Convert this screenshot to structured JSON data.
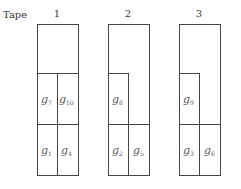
{
  "header": {
    "label": "Tape"
  },
  "tapes": [
    {
      "number": "1",
      "cells": [
        {
          "id": "g7",
          "base": "g",
          "sub": "7"
        },
        {
          "id": "g10",
          "base": "g",
          "sub": "10"
        },
        {
          "id": "g1",
          "base": "g",
          "sub": "1"
        },
        {
          "id": "g4",
          "base": "g",
          "sub": "4"
        }
      ]
    },
    {
      "number": "2",
      "cells": [
        {
          "id": "g8",
          "base": "g",
          "sub": "8"
        },
        {
          "id": "g2",
          "base": "g",
          "sub": "2"
        },
        {
          "id": "g5",
          "base": "g",
          "sub": "5"
        }
      ]
    },
    {
      "number": "3",
      "cells": [
        {
          "id": "g9",
          "base": "g",
          "sub": "9"
        },
        {
          "id": "g3",
          "base": "g",
          "sub": "3"
        },
        {
          "id": "g6",
          "base": "g",
          "sub": "6"
        }
      ]
    }
  ]
}
